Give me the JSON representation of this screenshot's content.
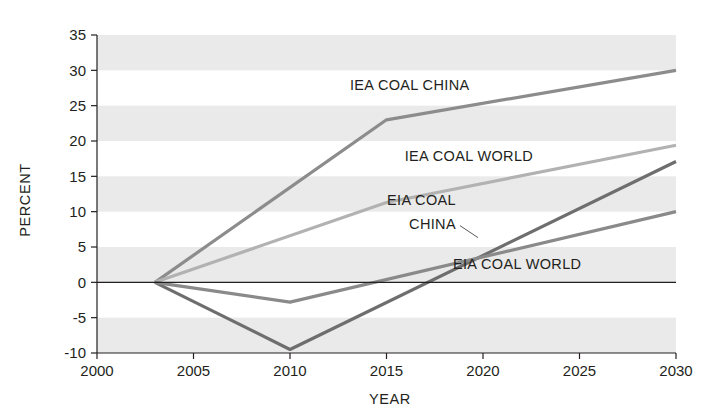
{
  "chart_data": {
    "type": "line",
    "title": "",
    "subtitle": "",
    "xlabel": "YEAR",
    "ylabel": "PERCENT",
    "xlim": [
      2000,
      2030
    ],
    "ylim": [
      -10,
      35
    ],
    "xticks": [
      2000,
      2005,
      2010,
      2015,
      2020,
      2025,
      2030
    ],
    "yticks": [
      35,
      30,
      25,
      20,
      15,
      10,
      5,
      0,
      -5,
      -10
    ],
    "xtick_labels": [
      "2000",
      "2005",
      "2010",
      "2015",
      "2020",
      "2025",
      "2030"
    ],
    "ytick_labels": [
      "35",
      "30",
      "25",
      "20",
      "15",
      "10",
      "5",
      "0",
      "-5",
      "-10"
    ],
    "grid": false,
    "banding": "alternating horizontal gray bands every 5 percent",
    "zero_line": true,
    "legend_position": "inline-annotations",
    "series": [
      {
        "name": "IEA COAL CHINA",
        "color": "#8c8c8c",
        "x": [
          2003,
          2015,
          2030
        ],
        "values": [
          0,
          23,
          30
        ],
        "label_x": 2019.3,
        "label_y": 27.2,
        "label_anchor": "end",
        "leader": false
      },
      {
        "name": "IEA COAL WORLD",
        "color": "#b2b2b2",
        "x": [
          2003,
          2015,
          2030
        ],
        "values": [
          0,
          11.3,
          19.4
        ],
        "label_x": 2022.6,
        "label_y": 17.2,
        "label_anchor": "end",
        "leader": false
      },
      {
        "name": "EIA COAL CHINA",
        "color": "#6e6e6e",
        "x": [
          2003,
          2010,
          2030
        ],
        "values": [
          0,
          -9.5,
          17.1
        ],
        "label_x": 2018.6,
        "label_y": 11.0,
        "label_line2_y": 7.6,
        "label_anchor": "end",
        "leader": true
      },
      {
        "name": "EIA COAL WORLD",
        "color": "#8a8a8a",
        "x": [
          2003,
          2010,
          2030
        ],
        "values": [
          0,
          -2.8,
          10.0
        ],
        "label_x": 2025.1,
        "label_y": 1.9,
        "label_anchor": "end",
        "leader": false
      }
    ]
  },
  "colors": {
    "band": "#eaeaea",
    "background": "#ffffff",
    "axis": "#231f20",
    "text": "#231f20"
  }
}
